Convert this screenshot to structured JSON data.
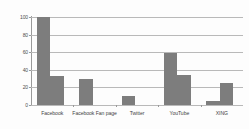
{
  "chart_data": {
    "type": "bar",
    "title": "",
    "subtitle": "",
    "xlabel": "",
    "ylabel": "",
    "categories": [
      "Facebook",
      "Facebook Fan page",
      "Twitter",
      "YouTube",
      "XING"
    ],
    "series": [
      {
        "name": "Series 1",
        "values": [
          100,
          30,
          10,
          59,
          5
        ]
      },
      {
        "name": "Series 2",
        "values": [
          33,
          0,
          0,
          34,
          25
        ]
      }
    ],
    "ylim": [
      0,
      100
    ],
    "yticks": [
      0,
      20,
      40,
      60,
      80,
      100
    ],
    "ytick_labels": [
      "0",
      "20",
      "40",
      "60",
      "80",
      "100"
    ],
    "grid": true,
    "legend": "none",
    "bar_color": "#7d7d7d",
    "grid_color": "#b9b9b9",
    "axis_color": "#9a9a9a",
    "background_color": "#fdfdfd"
  }
}
